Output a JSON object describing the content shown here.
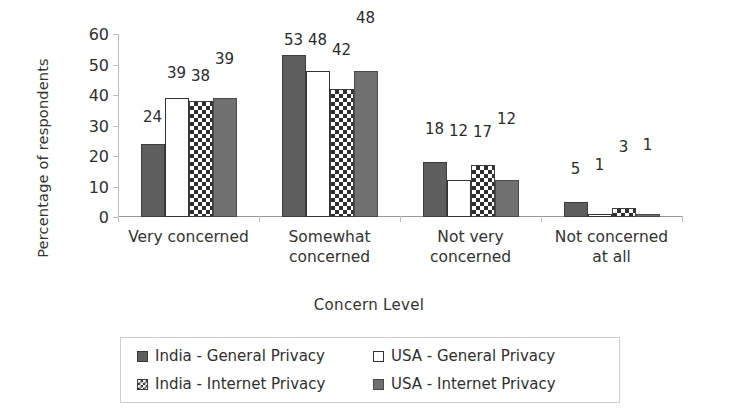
{
  "chart_data": {
    "type": "bar",
    "title": "",
    "xlabel": "Concern Level",
    "ylabel": "Percentage of respondents",
    "ylim": [
      0,
      60
    ],
    "yticks": [
      0,
      10,
      20,
      30,
      40,
      50,
      60
    ],
    "grid": false,
    "legend_position": "bottom",
    "categories": [
      "Very concerned",
      "Somewhat concerned",
      "Not very concerned",
      "Not concerned at all"
    ],
    "category_lines": [
      [
        "Very concerned"
      ],
      [
        "Somewhat",
        "concerned"
      ],
      [
        "Not very",
        "concerned"
      ],
      [
        "Not concerned",
        "at all"
      ]
    ],
    "series": [
      {
        "name": "India - General Privacy",
        "pattern": "solid-dark",
        "color": "#5e5e5e",
        "values": [
          24,
          53,
          18,
          5
        ]
      },
      {
        "name": "USA - General Privacy",
        "pattern": "open-white",
        "color": "#ffffff",
        "values": [
          39,
          48,
          12,
          1
        ]
      },
      {
        "name": "India - Internet Privacy",
        "pattern": "checkerboard",
        "color": "#2f2f2f",
        "values": [
          38,
          42,
          17,
          3
        ]
      },
      {
        "name": "USA - Internet Privacy",
        "pattern": "solid-gray",
        "color": "#707070",
        "values": [
          39,
          48,
          12,
          1
        ]
      }
    ]
  },
  "legend": {
    "items": [
      "India - General Privacy",
      "USA - General Privacy",
      "India - Internet Privacy",
      "USA - Internet Privacy"
    ]
  }
}
